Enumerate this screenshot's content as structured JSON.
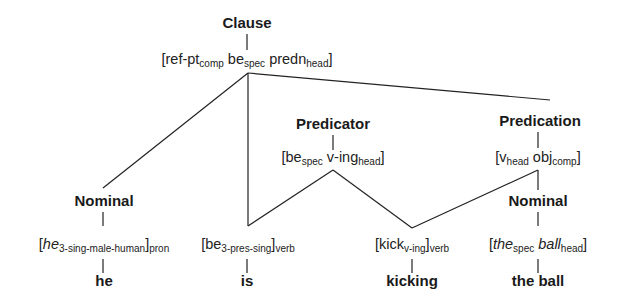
{
  "clause": {
    "label": "Clause",
    "features": {
      "open": "[",
      "f1": "ref-pt",
      "f1_sub": "comp",
      "f2": "be",
      "f2_sub": "spec",
      "f3": "predn",
      "f3_sub": "head",
      "close": "]"
    }
  },
  "predicator": {
    "label": "Predicator",
    "features": {
      "open": "[",
      "f1": "be",
      "f1_sub": "spec",
      "f2": "v-ing",
      "f2_sub": "head",
      "close": "]"
    }
  },
  "predication": {
    "label": "Predication",
    "features": {
      "open": "[",
      "f1": "v",
      "f1_sub": "head",
      "f2": "obj",
      "f2_sub": "comp",
      "close": "]"
    }
  },
  "nominal_subject": {
    "label": "Nominal",
    "features": {
      "open": "[",
      "f1": "he",
      "f1_sub": "3-sing-male-human",
      "close": "]",
      "outer_sub": "pron"
    },
    "word": "he"
  },
  "verb_be": {
    "features": {
      "open": "[",
      "f1": "be",
      "f1_sub": "3-pres-sing",
      "close": "]",
      "outer_sub": "verb"
    },
    "word": "is"
  },
  "verb_kick": {
    "features": {
      "open": "[",
      "f1": "kick",
      "f1_sub": "v-ing",
      "close": "]",
      "outer_sub": "verb"
    },
    "word": "kicking"
  },
  "nominal_object": {
    "label": "Nominal",
    "features": {
      "open": "[",
      "f1": "the",
      "f1_sub": "spec",
      "f2": "ball",
      "f2_sub": "head",
      "close": "]"
    },
    "word": "the ball"
  }
}
